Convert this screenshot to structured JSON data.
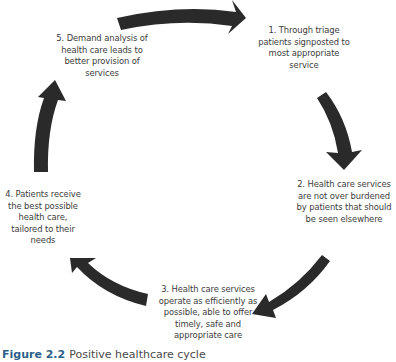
{
  "diagram": {
    "type": "cycle",
    "arrow_color": "#2a2a2a",
    "nodes": [
      {
        "label": "1. Through triage patients signposted to most appropriate service"
      },
      {
        "label": "2. Health care services are not over burdened by patients that should be seen elsewhere"
      },
      {
        "label": "3. Health care services operate as efficiently as possible, able to offer timely, safe and appropriate care"
      },
      {
        "label": "4. Patients receive the best possible health care, tailored to their needs"
      },
      {
        "label": "5. Demand analysis of health care leads to better provision of services"
      }
    ]
  },
  "caption": {
    "label": "Figure 2.2",
    "text": "Positive healthcare cycle",
    "label_color": "#2d5f8a"
  }
}
